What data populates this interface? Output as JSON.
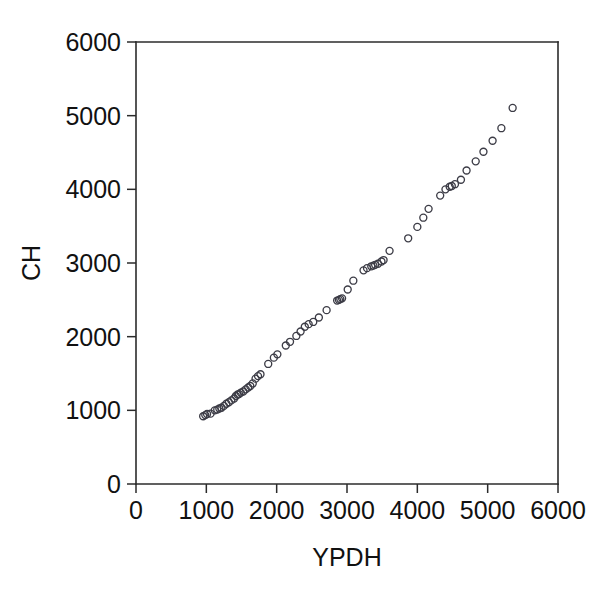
{
  "chart_data": {
    "type": "scatter",
    "title": "",
    "xlabel": "YPDH",
    "ylabel": "CH",
    "xlim": [
      0,
      6000
    ],
    "ylim": [
      0,
      6000
    ],
    "xticks": [
      0,
      1000,
      2000,
      3000,
      4000,
      5000,
      6000
    ],
    "yticks": [
      0,
      1000,
      2000,
      3000,
      4000,
      5000,
      6000
    ],
    "xtick_labels": [
      "0",
      "1000",
      "2000",
      "3000",
      "4000",
      "5000",
      "6000"
    ],
    "ytick_labels": [
      "0",
      "1000",
      "2000",
      "3000",
      "4000",
      "5000",
      "6000"
    ],
    "grid": false,
    "legend": false,
    "legend_position": "none",
    "marker": "open-circle",
    "marker_color": "#3c3c46",
    "marker_size": 7,
    "background_color": "#ffffff",
    "axis_color": "#2b2b2b",
    "n_points": 62,
    "series": [
      {
        "name": "CH vs YPDH",
        "points": [
          [
            955,
            920
          ],
          [
            985,
            935
          ],
          [
            1010,
            950
          ],
          [
            1060,
            955
          ],
          [
            1120,
            1000
          ],
          [
            1155,
            1010
          ],
          [
            1185,
            1025
          ],
          [
            1215,
            1035
          ],
          [
            1250,
            1060
          ],
          [
            1285,
            1090
          ],
          [
            1320,
            1110
          ],
          [
            1355,
            1135
          ],
          [
            1395,
            1160
          ],
          [
            1420,
            1195
          ],
          [
            1445,
            1215
          ],
          [
            1465,
            1220
          ],
          [
            1490,
            1240
          ],
          [
            1525,
            1255
          ],
          [
            1560,
            1285
          ],
          [
            1595,
            1310
          ],
          [
            1625,
            1330
          ],
          [
            1660,
            1365
          ],
          [
            1700,
            1430
          ],
          [
            1735,
            1465
          ],
          [
            1770,
            1490
          ],
          [
            1880,
            1630
          ],
          [
            1960,
            1715
          ],
          [
            2010,
            1760
          ],
          [
            2130,
            1880
          ],
          [
            2190,
            1930
          ],
          [
            2280,
            2010
          ],
          [
            2340,
            2070
          ],
          [
            2400,
            2135
          ],
          [
            2455,
            2170
          ],
          [
            2520,
            2200
          ],
          [
            2600,
            2260
          ],
          [
            2710,
            2360
          ],
          [
            2860,
            2490
          ],
          [
            2885,
            2500
          ],
          [
            2905,
            2510
          ],
          [
            2930,
            2520
          ],
          [
            3010,
            2640
          ],
          [
            3090,
            2760
          ],
          [
            3235,
            2900
          ],
          [
            3285,
            2930
          ],
          [
            3345,
            2955
          ],
          [
            3375,
            2965
          ],
          [
            3400,
            2975
          ],
          [
            3440,
            2990
          ],
          [
            3490,
            3020
          ],
          [
            3520,
            3040
          ],
          [
            3605,
            3165
          ],
          [
            3870,
            3335
          ],
          [
            4000,
            3490
          ],
          [
            4085,
            3615
          ],
          [
            4160,
            3735
          ],
          [
            4325,
            3915
          ],
          [
            4400,
            4000
          ],
          [
            4460,
            4035
          ],
          [
            4490,
            4045
          ],
          [
            4535,
            4070
          ],
          [
            4620,
            4130
          ],
          [
            4700,
            4255
          ],
          [
            4830,
            4380
          ],
          [
            4940,
            4510
          ],
          [
            5070,
            4660
          ],
          [
            5195,
            4830
          ],
          [
            5355,
            5105
          ]
        ]
      }
    ]
  },
  "axes": {
    "x_title": "YPDH",
    "y_title": "CH"
  }
}
